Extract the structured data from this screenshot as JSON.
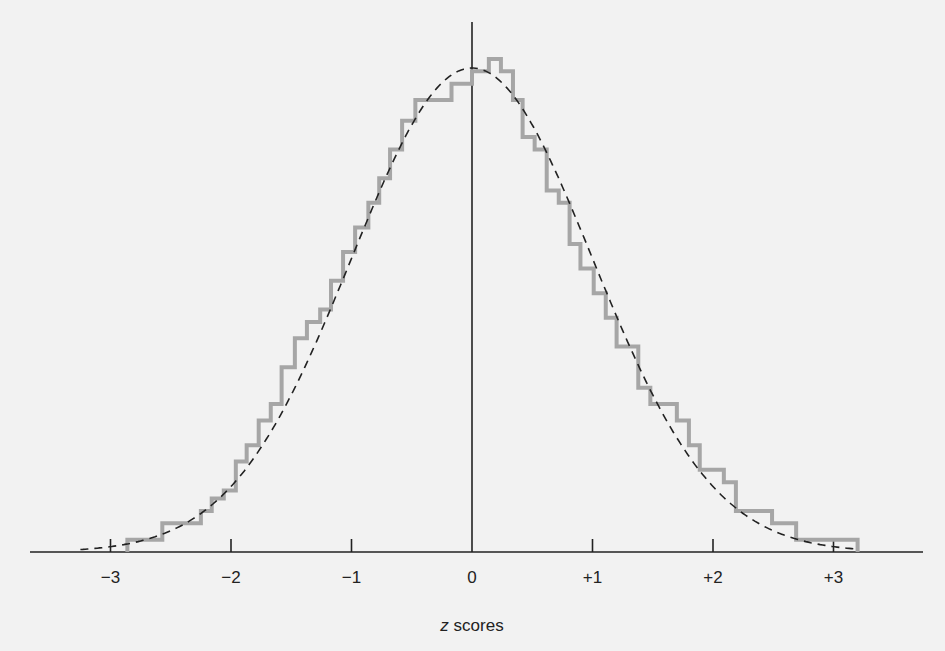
{
  "chart_data": {
    "type": "line",
    "title": "",
    "xlabel": "z scores",
    "xlabel_parts": {
      "var": "z",
      "rest": " scores"
    },
    "ylabel": "",
    "xlim": [
      -3.4,
      3.3
    ],
    "grid": false,
    "legend": null,
    "x_ticks": [
      -3,
      -2,
      -1,
      0,
      1,
      2,
      3
    ],
    "x_tick_labels": [
      "−3",
      "−2",
      "−1",
      "0",
      "+1",
      "+2",
      "+3"
    ],
    "series": [
      {
        "name": "Observed distribution (step histogram)",
        "style": "solid-gray-step",
        "color": "#a6a6a6",
        "bin_edges": [
          -2.86,
          -2.57,
          -2.25,
          -2.16,
          -2.06,
          -1.96,
          -1.87,
          -1.77,
          -1.67,
          -1.58,
          -1.47,
          -1.37,
          -1.26,
          -1.17,
          -1.07,
          -0.97,
          -0.86,
          -0.77,
          -0.68,
          -0.58,
          -0.47,
          -0.17,
          0.0,
          0.14,
          0.24,
          0.34,
          0.42,
          0.52,
          0.62,
          0.72,
          0.81,
          0.9,
          1.01,
          1.11,
          1.2,
          1.38,
          1.48,
          1.7,
          1.8,
          1.89,
          2.09,
          2.19,
          2.49,
          2.69,
          3.2
        ],
        "relative_heights": [
          0.03,
          0.07,
          0.1,
          0.13,
          0.15,
          0.22,
          0.26,
          0.32,
          0.36,
          0.45,
          0.52,
          0.56,
          0.59,
          0.66,
          0.73,
          0.79,
          0.85,
          0.91,
          0.98,
          1.05,
          1.1,
          1.14,
          1.17,
          1.2,
          1.17,
          1.1,
          1.01,
          0.98,
          0.88,
          0.85,
          0.75,
          0.69,
          0.63,
          0.57,
          0.5,
          0.4,
          0.36,
          0.32,
          0.26,
          0.2,
          0.17,
          0.1,
          0.07,
          0.03
        ]
      },
      {
        "name": "Normal curve",
        "style": "dashed-black",
        "color": "#222222",
        "function": "standard normal density",
        "peak_at": 0
      }
    ]
  }
}
